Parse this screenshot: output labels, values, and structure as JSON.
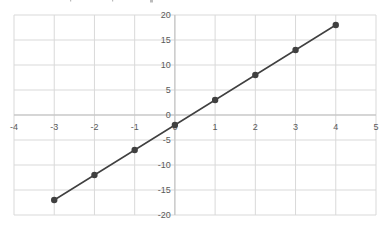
{
  "chart_data": {
    "type": "scatter",
    "mode": "lines+markers",
    "title": "",
    "xlabel": "",
    "ylabel": "",
    "xlim": [
      -4,
      5
    ],
    "ylim": [
      -20,
      20
    ],
    "x_ticks": [
      -4,
      -3,
      -2,
      -1,
      0,
      1,
      2,
      3,
      4,
      5
    ],
    "y_ticks": [
      -20,
      -15,
      -10,
      -5,
      0,
      5,
      10,
      15,
      20
    ],
    "grid": true,
    "legend": null,
    "series": [
      {
        "name": "series1",
        "color": "#404040",
        "x": [
          -3,
          -2,
          -1,
          0,
          1,
          2,
          3,
          4
        ],
        "y": [
          -17,
          -12,
          -7,
          -2,
          3,
          8,
          13,
          18
        ]
      }
    ]
  },
  "colors": {
    "grid": "#d9d9d9",
    "axis": "#bfbfbf",
    "line": "#404040",
    "marker": "#404040",
    "tick_label": "#595959"
  }
}
